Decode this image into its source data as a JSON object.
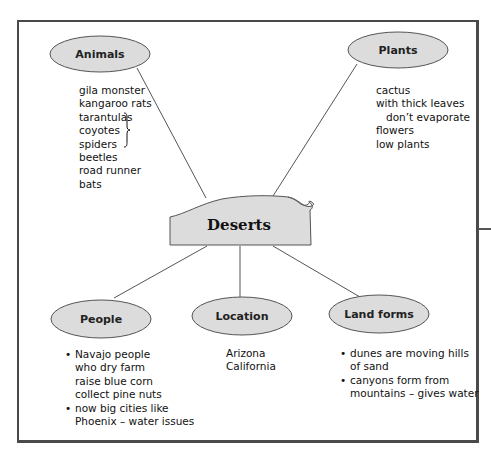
{
  "diagram": {
    "type": "concept-map",
    "center": {
      "label": "Deserts"
    },
    "nodes": {
      "animals": {
        "label": "Animals",
        "items": [
          "gila monster",
          "kangaroo rats",
          "tarantulas",
          "coyotes",
          "spiders",
          "beetles",
          "road runner",
          "bats"
        ],
        "brace_groups": [
          [
            "tarantulas",
            "coyotes",
            "spiders"
          ]
        ]
      },
      "plants": {
        "label": "Plants",
        "items": [
          "cactus",
          "with thick leaves",
          "don’t evaporate",
          "flowers",
          "low plants"
        ]
      },
      "people": {
        "label": "People",
        "items": [
          "Navajo people",
          "who dry farm",
          "raise blue corn",
          "collect pine nuts",
          "now big cities like",
          "Phoenix – water issues"
        ]
      },
      "location": {
        "label": "Location",
        "items": [
          "Arizona",
          "California"
        ]
      },
      "land_forms": {
        "label": "Land forms",
        "items": [
          "dunes are moving hills",
          "of sand",
          "canyons form from",
          "mountains – gives water"
        ]
      }
    },
    "bullet_char": "•",
    "brace_char": "}",
    "colors": {
      "node_fill": "#dcdcdc",
      "node_stroke": "#555555",
      "line": "#555555",
      "frame": "#4a4a4a",
      "text": "#111111"
    }
  }
}
